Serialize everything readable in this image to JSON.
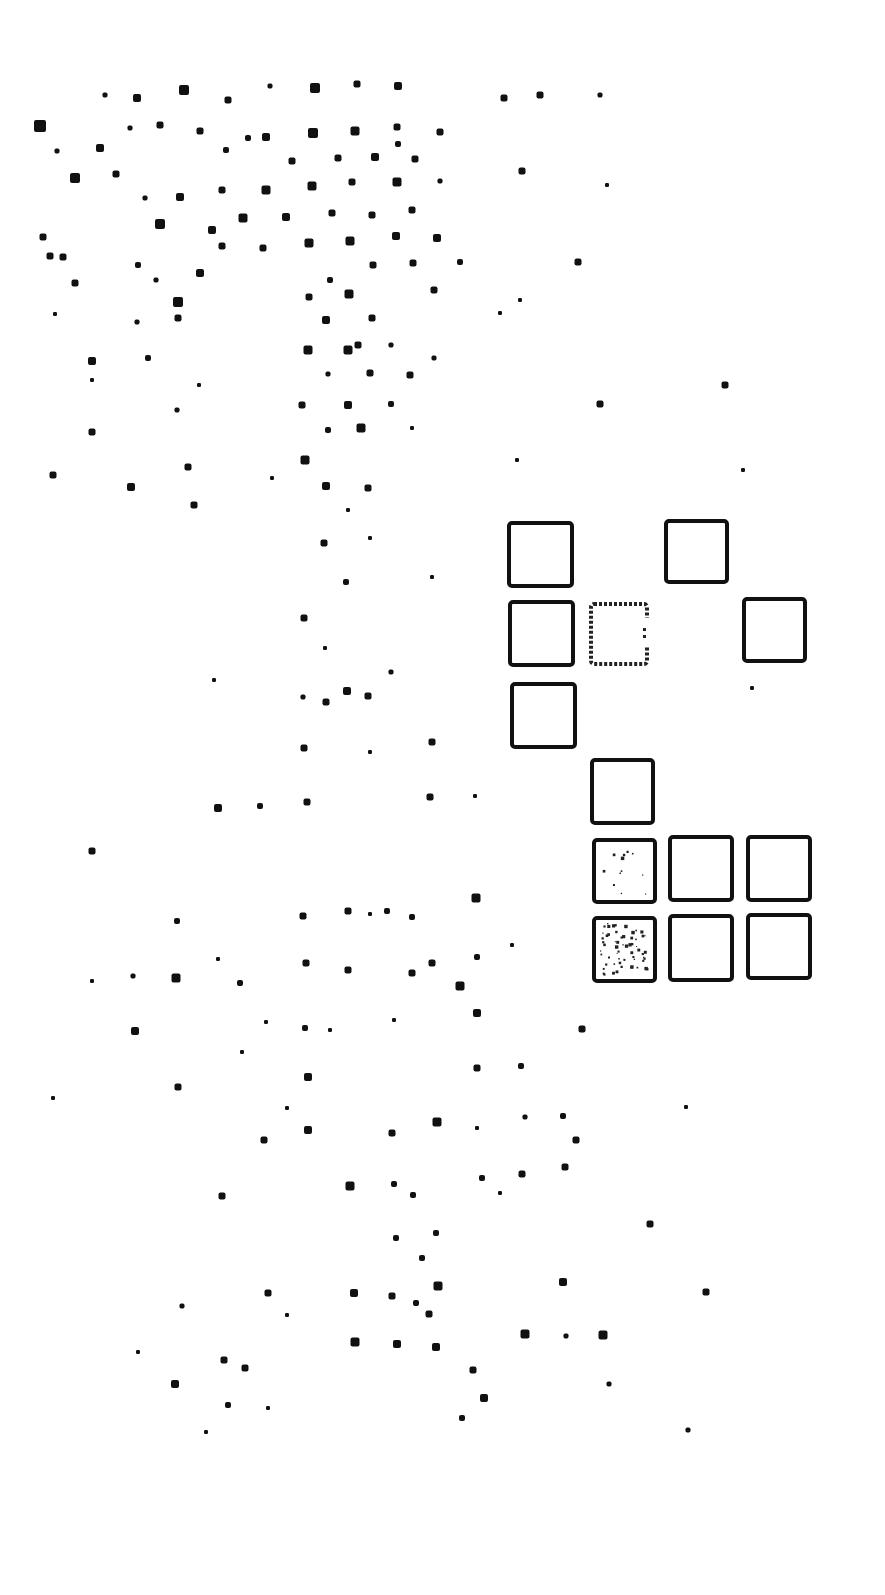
{
  "figure": {
    "width": 885,
    "height": 1595,
    "background": "#ffffff",
    "ink": "#111111",
    "dots": [
      [
        105,
        95,
        5
      ],
      [
        137,
        98,
        8
      ],
      [
        184,
        90,
        10
      ],
      [
        228,
        100,
        7
      ],
      [
        270,
        86,
        5
      ],
      [
        315,
        88,
        10
      ],
      [
        357,
        84,
        7
      ],
      [
        398,
        86,
        8
      ],
      [
        504,
        98,
        7
      ],
      [
        540,
        95,
        7
      ],
      [
        600,
        95,
        5
      ],
      [
        40,
        126,
        12
      ],
      [
        130,
        128,
        5
      ],
      [
        160,
        125,
        7
      ],
      [
        200,
        131,
        7
      ],
      [
        266,
        137,
        8
      ],
      [
        313,
        133,
        10
      ],
      [
        355,
        131,
        9
      ],
      [
        397,
        127,
        7
      ],
      [
        440,
        132,
        7
      ],
      [
        57,
        151,
        5
      ],
      [
        100,
        148,
        8
      ],
      [
        226,
        150,
        6
      ],
      [
        248,
        138,
        6
      ],
      [
        292,
        161,
        7
      ],
      [
        338,
        158,
        7
      ],
      [
        375,
        157,
        8
      ],
      [
        398,
        144,
        6
      ],
      [
        415,
        159,
        7
      ],
      [
        522,
        171,
        7
      ],
      [
        75,
        178,
        10
      ],
      [
        116,
        174,
        7
      ],
      [
        180,
        197,
        8
      ],
      [
        222,
        190,
        7
      ],
      [
        266,
        190,
        9
      ],
      [
        312,
        186,
        9
      ],
      [
        352,
        182,
        7
      ],
      [
        397,
        182,
        9
      ],
      [
        440,
        181,
        5
      ],
      [
        607,
        185,
        4
      ],
      [
        145,
        198,
        5
      ],
      [
        160,
        224,
        10
      ],
      [
        212,
        230,
        8
      ],
      [
        243,
        218,
        9
      ],
      [
        286,
        217,
        8
      ],
      [
        332,
        213,
        7
      ],
      [
        372,
        215,
        7
      ],
      [
        412,
        210,
        7
      ],
      [
        43,
        237,
        7
      ],
      [
        50,
        256,
        7
      ],
      [
        63,
        257,
        7
      ],
      [
        222,
        246,
        7
      ],
      [
        263,
        248,
        7
      ],
      [
        309,
        243,
        9
      ],
      [
        350,
        241,
        9
      ],
      [
        396,
        236,
        8
      ],
      [
        437,
        238,
        8
      ],
      [
        578,
        262,
        7
      ],
      [
        138,
        265,
        6
      ],
      [
        156,
        280,
        5
      ],
      [
        200,
        273,
        8
      ],
      [
        330,
        280,
        6
      ],
      [
        373,
        265,
        7
      ],
      [
        413,
        263,
        7
      ],
      [
        460,
        262,
        6
      ],
      [
        75,
        283,
        7
      ],
      [
        178,
        302,
        10
      ],
      [
        309,
        297,
        7
      ],
      [
        349,
        294,
        9
      ],
      [
        434,
        290,
        7
      ],
      [
        500,
        313,
        4
      ],
      [
        520,
        300,
        4
      ],
      [
        55,
        314,
        4
      ],
      [
        137,
        322,
        5
      ],
      [
        178,
        318,
        7
      ],
      [
        326,
        320,
        8
      ],
      [
        372,
        318,
        7
      ],
      [
        92,
        361,
        8
      ],
      [
        148,
        358,
        6
      ],
      [
        308,
        350,
        9
      ],
      [
        348,
        350,
        9
      ],
      [
        358,
        345,
        7
      ],
      [
        391,
        345,
        5
      ],
      [
        434,
        358,
        5
      ],
      [
        92,
        380,
        4
      ],
      [
        199,
        385,
        4
      ],
      [
        328,
        374,
        5
      ],
      [
        370,
        373,
        7
      ],
      [
        410,
        375,
        7
      ],
      [
        725,
        385,
        7
      ],
      [
        177,
        410,
        5
      ],
      [
        302,
        405,
        7
      ],
      [
        348,
        405,
        8
      ],
      [
        391,
        404,
        6
      ],
      [
        600,
        404,
        7
      ],
      [
        92,
        432,
        7
      ],
      [
        328,
        430,
        6
      ],
      [
        361,
        428,
        9
      ],
      [
        412,
        428,
        4
      ],
      [
        188,
        467,
        7
      ],
      [
        305,
        460,
        9
      ],
      [
        517,
        460,
        4
      ],
      [
        743,
        470,
        4
      ],
      [
        53,
        475,
        7
      ],
      [
        131,
        487,
        8
      ],
      [
        194,
        505,
        7
      ],
      [
        272,
        478,
        4
      ],
      [
        326,
        486,
        8
      ],
      [
        368,
        488,
        7
      ],
      [
        348,
        510,
        4
      ],
      [
        324,
        543,
        7
      ],
      [
        370,
        538,
        4
      ],
      [
        346,
        582,
        6
      ],
      [
        432,
        577,
        4
      ],
      [
        304,
        618,
        7
      ],
      [
        325,
        648,
        4
      ],
      [
        391,
        672,
        5
      ],
      [
        752,
        688,
        4
      ],
      [
        214,
        680,
        4
      ],
      [
        303,
        697,
        5
      ],
      [
        326,
        702,
        7
      ],
      [
        347,
        691,
        8
      ],
      [
        368,
        696,
        7
      ],
      [
        304,
        748,
        7
      ],
      [
        370,
        752,
        4
      ],
      [
        432,
        742,
        7
      ],
      [
        218,
        808,
        8
      ],
      [
        260,
        806,
        6
      ],
      [
        307,
        802,
        7
      ],
      [
        430,
        797,
        7
      ],
      [
        475,
        796,
        4
      ],
      [
        92,
        851,
        7
      ],
      [
        177,
        921,
        6
      ],
      [
        303,
        916,
        7
      ],
      [
        348,
        911,
        7
      ],
      [
        370,
        914,
        4
      ],
      [
        387,
        911,
        6
      ],
      [
        412,
        917,
        6
      ],
      [
        476,
        898,
        9
      ],
      [
        92,
        981,
        4
      ],
      [
        133,
        976,
        5
      ],
      [
        176,
        978,
        9
      ],
      [
        218,
        959,
        4
      ],
      [
        240,
        983,
        6
      ],
      [
        306,
        963,
        7
      ],
      [
        348,
        970,
        7
      ],
      [
        412,
        973,
        7
      ],
      [
        432,
        963,
        7
      ],
      [
        460,
        986,
        9
      ],
      [
        477,
        957,
        6
      ],
      [
        512,
        945,
        4
      ],
      [
        135,
        1031,
        8
      ],
      [
        266,
        1022,
        4
      ],
      [
        305,
        1028,
        6
      ],
      [
        330,
        1030,
        4
      ],
      [
        394,
        1020,
        4
      ],
      [
        477,
        1013,
        8
      ],
      [
        582,
        1029,
        7
      ],
      [
        53,
        1098,
        4
      ],
      [
        178,
        1087,
        7
      ],
      [
        242,
        1052,
        4
      ],
      [
        308,
        1077,
        8
      ],
      [
        477,
        1068,
        7
      ],
      [
        521,
        1066,
        6
      ],
      [
        264,
        1140,
        7
      ],
      [
        287,
        1108,
        4
      ],
      [
        308,
        1130,
        8
      ],
      [
        392,
        1133,
        7
      ],
      [
        437,
        1122,
        9
      ],
      [
        477,
        1128,
        4
      ],
      [
        525,
        1117,
        5
      ],
      [
        563,
        1116,
        6
      ],
      [
        576,
        1140,
        7
      ],
      [
        686,
        1107,
        4
      ],
      [
        222,
        1196,
        7
      ],
      [
        350,
        1186,
        9
      ],
      [
        394,
        1184,
        6
      ],
      [
        413,
        1195,
        6
      ],
      [
        482,
        1178,
        6
      ],
      [
        522,
        1174,
        7
      ],
      [
        565,
        1167,
        7
      ],
      [
        500,
        1193,
        4
      ],
      [
        396,
        1238,
        6
      ],
      [
        436,
        1233,
        6
      ],
      [
        422,
        1258,
        6
      ],
      [
        650,
        1224,
        7
      ],
      [
        182,
        1306,
        5
      ],
      [
        268,
        1293,
        7
      ],
      [
        287,
        1315,
        4
      ],
      [
        354,
        1293,
        8
      ],
      [
        392,
        1296,
        7
      ],
      [
        416,
        1303,
        6
      ],
      [
        438,
        1286,
        9
      ],
      [
        429,
        1314,
        7
      ],
      [
        563,
        1282,
        8
      ],
      [
        706,
        1292,
        7
      ],
      [
        138,
        1352,
        4
      ],
      [
        224,
        1360,
        7
      ],
      [
        245,
        1368,
        7
      ],
      [
        355,
        1342,
        9
      ],
      [
        397,
        1344,
        8
      ],
      [
        436,
        1347,
        8
      ],
      [
        525,
        1334,
        9
      ],
      [
        566,
        1336,
        5
      ],
      [
        603,
        1335,
        9
      ],
      [
        609,
        1384,
        5
      ],
      [
        175,
        1384,
        8
      ],
      [
        228,
        1405,
        6
      ],
      [
        268,
        1408,
        4
      ],
      [
        473,
        1370,
        7
      ],
      [
        484,
        1398,
        8
      ],
      [
        462,
        1418,
        6
      ],
      [
        206,
        1432,
        4
      ],
      [
        688,
        1430,
        5
      ]
    ],
    "squares": [
      {
        "id": "sq-r1c1",
        "x": 509,
        "y": 523,
        "w": 63,
        "h": 63,
        "style": "outline"
      },
      {
        "id": "sq-r1c3",
        "x": 666,
        "y": 521,
        "w": 61,
        "h": 61,
        "style": "outline"
      },
      {
        "id": "sq-r2c1",
        "x": 510,
        "y": 602,
        "w": 63,
        "h": 63,
        "style": "outline"
      },
      {
        "id": "sq-r2c2",
        "x": 591,
        "y": 604,
        "w": 56,
        "h": 60,
        "style": "broken"
      },
      {
        "id": "sq-r2c4",
        "x": 744,
        "y": 599,
        "w": 61,
        "h": 62,
        "style": "outline"
      },
      {
        "id": "sq-r3c1",
        "x": 512,
        "y": 684,
        "w": 63,
        "h": 63,
        "style": "outline"
      },
      {
        "id": "sq-r4c2",
        "x": 592,
        "y": 760,
        "w": 61,
        "h": 63,
        "style": "outline"
      },
      {
        "id": "sq-r5c2",
        "x": 594,
        "y": 840,
        "w": 61,
        "h": 62,
        "style": "light-speckle"
      },
      {
        "id": "sq-r5c3",
        "x": 670,
        "y": 837,
        "w": 62,
        "h": 63,
        "style": "outline"
      },
      {
        "id": "sq-r5c4",
        "x": 748,
        "y": 837,
        "w": 62,
        "h": 63,
        "style": "outline"
      },
      {
        "id": "sq-r6c2",
        "x": 594,
        "y": 918,
        "w": 61,
        "h": 63,
        "style": "heavy-speckle"
      },
      {
        "id": "sq-r6c3",
        "x": 670,
        "y": 916,
        "w": 62,
        "h": 64,
        "style": "outline"
      },
      {
        "id": "sq-r6c4",
        "x": 748,
        "y": 915,
        "w": 62,
        "h": 63,
        "style": "outline"
      }
    ],
    "speckle_density": {
      "light-speckle": 12,
      "heavy-speckle": 60
    }
  }
}
